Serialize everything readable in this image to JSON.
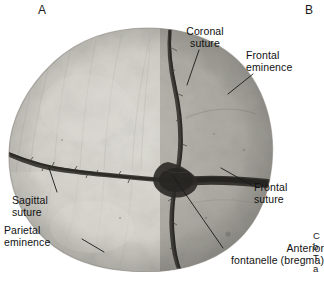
{
  "figure": {
    "type": "anatomical-photograph",
    "panels": [
      {
        "id": "A",
        "letter": "A"
      },
      {
        "id": "B",
        "letter": "B"
      }
    ]
  },
  "panel_letters": {
    "a": "A",
    "b": "B"
  },
  "labels": {
    "coronal_suture": "Coronal\nsuture",
    "frontal_eminence": "Frontal\neminence",
    "frontal_suture": "Frontal\nsuture",
    "sagittal_suture": "Sagittal\nsuture",
    "parietal_eminence": "Parietal\neminence",
    "anterior_fontanelle": "Anterior\nfontanelle (bregma)"
  },
  "caption_clipped": {
    "line1": "C",
    "line2": "b",
    "line3": "T",
    "line4": "a"
  },
  "colors": {
    "background": "#ffffff",
    "text": "#111111",
    "bone_light": "#d8d6d0",
    "bone_mid": "#b9b7b1",
    "bone_dark": "#8e8c87",
    "suture_dark": "#1d1c1a",
    "leader_line": "#1a1a1a"
  }
}
